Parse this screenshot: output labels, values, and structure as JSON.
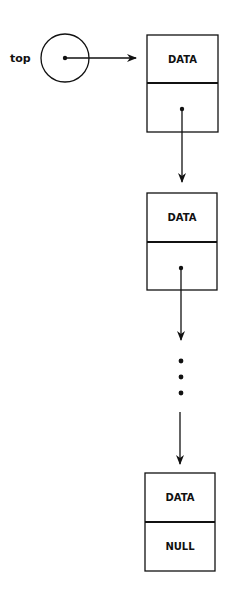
{
  "diagram": {
    "title": "",
    "pointer": {
      "label": "top"
    },
    "nodes": [
      {
        "data": "DATA",
        "next": ""
      },
      {
        "data": "DATA",
        "next": ""
      },
      {
        "data": "DATA",
        "next": "NULL"
      }
    ],
    "ellipsis": "..."
  },
  "colors": {
    "stroke": "#111111",
    "background": "#ffffff"
  }
}
